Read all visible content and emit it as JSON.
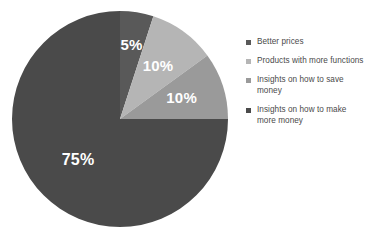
{
  "background_color": "#ffffff",
  "chart_data": {
    "type": "pie",
    "title": "",
    "start_angle_deg": 0,
    "direction": "clockwise",
    "labels_inside": true,
    "legend_position": "right",
    "categories": [
      "Better prices",
      "Products with more functions",
      "Insights on how to save money",
      "Insights on how to make more money"
    ],
    "values": [
      5,
      10,
      10,
      75
    ],
    "value_labels": [
      "5%",
      "10%",
      "10%",
      "75%"
    ],
    "colors": [
      "#595959",
      "#b5b5b5",
      "#9a9a9a",
      "#4a4a4a"
    ],
    "label_color": "#ffffff",
    "slices": [
      {
        "label": "Better prices",
        "value": 5,
        "value_label": "5%",
        "color": "#595959",
        "start_deg": 0,
        "end_deg": 18
      },
      {
        "label": "Products with more functions",
        "value": 10,
        "value_label": "10%",
        "color": "#b5b5b5",
        "start_deg": 18,
        "end_deg": 54
      },
      {
        "label": "Insights on how to save money",
        "value": 10,
        "value_label": "10%",
        "color": "#9a9a9a",
        "start_deg": 54,
        "end_deg": 90
      },
      {
        "label": "Insights on how to make more money",
        "value": 75,
        "value_label": "75%",
        "color": "#4a4a4a",
        "start_deg": 90,
        "end_deg": 360
      }
    ]
  },
  "legend": {
    "items": [
      {
        "label": "Better prices",
        "color": "#595959"
      },
      {
        "label": "Products with more functions",
        "color": "#b5b5b5"
      },
      {
        "label": "Insights on how to save money",
        "color": "#9a9a9a"
      },
      {
        "label": "Insights on how to make more money",
        "color": "#4a4a4a"
      }
    ]
  }
}
